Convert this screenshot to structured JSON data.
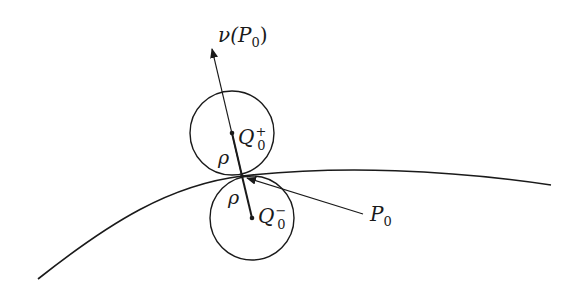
{
  "diagram": {
    "colors": {
      "stroke": "#1a1a1a",
      "background": "#ffffff"
    },
    "labels": {
      "normal": {
        "main": "ν(P",
        "sub": "0",
        "tail": ")"
      },
      "upper_center": {
        "main": "Q",
        "sub": "0",
        "sup": "+"
      },
      "lower_center": {
        "main": "Q",
        "sub": "0",
        "sup": "−"
      },
      "rho_upper": "ρ",
      "rho_lower": "ρ",
      "point": {
        "main": "P",
        "sub": "0"
      }
    },
    "geometry": {
      "boundary_curve": {
        "start": [
          38,
          279
        ],
        "control": [
          170,
          160
        ],
        "tangent_point": [
          242,
          176
        ],
        "end": [
          551,
          185
        ]
      },
      "upper_circle": {
        "cx": 232,
        "cy": 142,
        "r": 42
      },
      "lower_circle": {
        "cx": 252,
        "cy": 218,
        "r": 42
      },
      "normal_arrow": {
        "from": [
          252,
          218
        ],
        "to": [
          212,
          48
        ]
      },
      "p0_pointer": {
        "from": [
          360,
          214
        ],
        "to": [
          246,
          178
        ]
      }
    }
  }
}
